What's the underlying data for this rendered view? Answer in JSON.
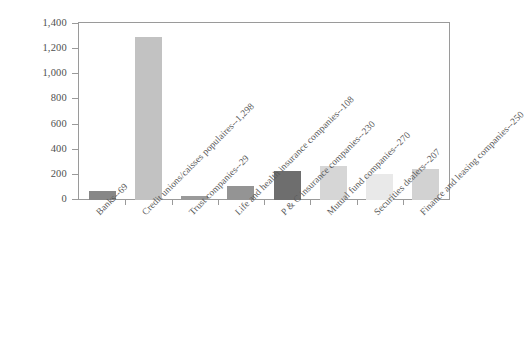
{
  "chart_data": {
    "type": "bar",
    "title": "",
    "subtitle": "",
    "xlabel": "",
    "ylabel": "",
    "categories": [
      "Banks--69",
      "Credit unions/caisses populaires--1,298",
      "Trust companies--29",
      "Life and health insurance companies--108",
      "P & C insurance companies--230",
      "Mutual fund companies--270",
      "Securities dealers--207",
      "Finance and leasing companies--250"
    ],
    "category_names": [
      "Banks",
      "Credit unions/caisses populaires",
      "Trust companies",
      "Life and health insurance companies",
      "P & C insurance companies",
      "Mutual fund companies",
      "Securities dealers",
      "Finance and leasing companies"
    ],
    "values": [
      69,
      1298,
      29,
      108,
      230,
      270,
      207,
      250
    ],
    "value_labels": [
      "69",
      "1,298",
      "29",
      "108",
      "230",
      "270",
      "207",
      "250"
    ],
    "bar_colors": [
      "#878787",
      "#c2c2c2",
      "#9a9a9a",
      "#949494",
      "#6e6e6e",
      "#d6d6d6",
      "#e9e9e9",
      "#d2d2d2"
    ],
    "ylim": [
      0,
      1400
    ],
    "ytick_values": [
      0,
      200,
      400,
      600,
      800,
      1000,
      1200,
      1400
    ],
    "ytick_labels": [
      "0",
      "200",
      "400",
      "600",
      "800",
      "1,000",
      "1,200",
      "1,400"
    ],
    "grid": false,
    "legend": null,
    "legend_position": "none",
    "frame_color": "#9a9a9a",
    "background": "#ffffff",
    "label_rotation_deg": -45
  }
}
